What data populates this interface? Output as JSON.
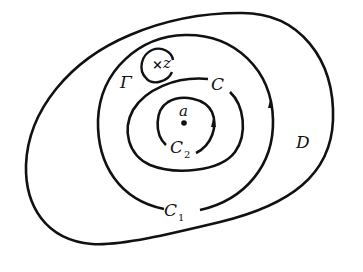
{
  "diagram": {
    "type": "complex-analysis contour diagram",
    "stroke_color": "#111111",
    "background": "#ffffff",
    "labels": {
      "region": "D",
      "outer_contour": "C",
      "outer_contour_sub": "1",
      "middle_contour": "C",
      "inner_contour": "C",
      "inner_contour_sub": "2",
      "small_contour": "Γ",
      "center_point": "a",
      "marked_point_symbol": "×",
      "marked_point": "z"
    }
  }
}
